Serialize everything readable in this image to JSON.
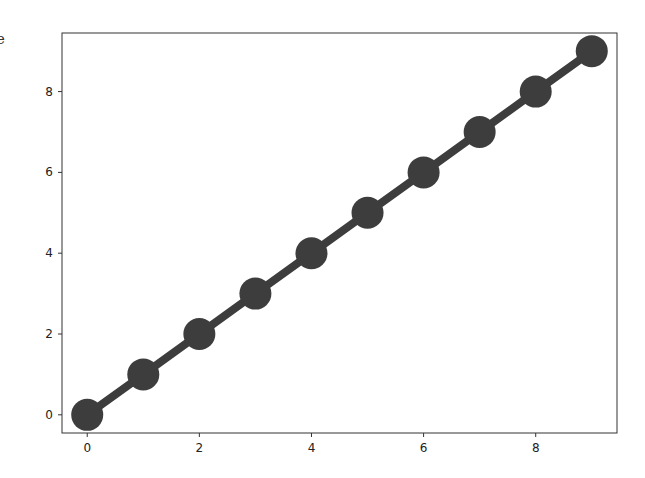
{
  "edge_fragment": "e",
  "chart_data": {
    "type": "line",
    "title": "",
    "xlabel": "",
    "ylabel": "",
    "x": [
      0,
      1,
      2,
      3,
      4,
      5,
      6,
      7,
      8,
      9
    ],
    "series": [
      {
        "name": "",
        "values": [
          0,
          1,
          2,
          3,
          4,
          5,
          6,
          7,
          8,
          9
        ],
        "color": "#3d3d3d",
        "marker": "circle"
      }
    ],
    "xlim": [
      -0.45,
      9.45
    ],
    "ylim": [
      -0.45,
      9.45
    ],
    "xticks": [
      0,
      2,
      4,
      6,
      8
    ],
    "yticks": [
      0,
      2,
      4,
      6,
      8
    ],
    "grid": false,
    "legend": null
  },
  "style": {
    "line_color": "#3d3d3d",
    "marker_color": "#3d3d3d",
    "axis_color": "#333333"
  }
}
